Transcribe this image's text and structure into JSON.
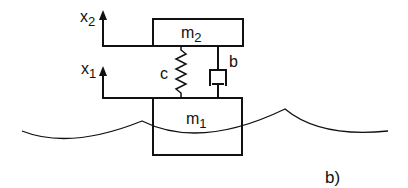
{
  "diagram": {
    "type": "mechanical-model",
    "masses": [
      {
        "id": "m2",
        "label": "m",
        "subscript": "2"
      },
      {
        "id": "m1",
        "label": "m",
        "subscript": "1"
      }
    ],
    "displacements": [
      {
        "id": "x2",
        "label": "x",
        "subscript": "2"
      },
      {
        "id": "x1",
        "label": "x",
        "subscript": "1"
      }
    ],
    "spring": {
      "label": "c"
    },
    "damper": {
      "label": "b"
    },
    "panel_label": "b)",
    "colors": {
      "stroke": "#111111",
      "background": "#ffffff"
    }
  }
}
